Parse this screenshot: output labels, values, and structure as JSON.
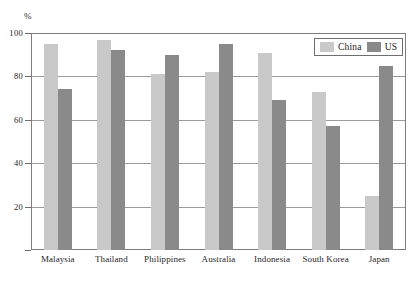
{
  "chart_data": {
    "type": "bar",
    "title": "",
    "xlabel": "",
    "ylabel": "%",
    "ylim": [
      0,
      100
    ],
    "yticks": [
      0,
      20,
      40,
      60,
      80,
      100
    ],
    "ytick_labels": [
      "0",
      "20",
      "40",
      "60",
      "80",
      "100"
    ],
    "grid": true,
    "legend_position": "top-right",
    "categories": [
      "Malaysia",
      "Thailand",
      "Philippines",
      "Australia",
      "Indonesia",
      "South Korea",
      "Japan"
    ],
    "series": [
      {
        "name": "China",
        "color": "#c9c9c9",
        "values": [
          95,
          97,
          81,
          82,
          91,
          73,
          25
        ]
      },
      {
        "name": "US",
        "color": "#8a8a8a",
        "values": [
          74,
          92,
          90,
          95,
          69,
          57,
          85
        ]
      }
    ]
  },
  "axis": {
    "unit_label": "%"
  },
  "legend": {
    "entries": [
      {
        "label": "China",
        "color": "#c9c9c9"
      },
      {
        "label": "US",
        "color": "#8a8a8a"
      }
    ]
  },
  "title_strip": {
    "text": ""
  }
}
